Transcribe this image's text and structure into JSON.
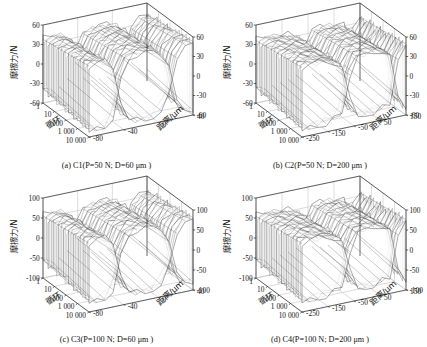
{
  "figure": {
    "type": "multi-panel-3d-surface",
    "panel_count": 4,
    "shared_axes": {
      "z_label": "摩擦力/N",
      "x_label": "循环",
      "y_label": "距离/μm",
      "x_ticks": [
        "1",
        "10",
        "100",
        "1 000",
        "10 000"
      ]
    }
  },
  "chart_data": [
    {
      "type": "line",
      "panel": "a",
      "caption_prefix": "(a)",
      "caption_sample": "C1",
      "caption_params": "(P=50 N; D=60 μm )",
      "caption_full": "(a) C1(P=50 N; D=60 μm )",
      "title": "C1(P=50 N; D=60 μm )",
      "xlabel": "循环",
      "ylabel": "距离/μm",
      "zlabel": "摩擦力/N",
      "x_ticks": [
        "1",
        "10",
        "100",
        "1 000",
        "10 000"
      ],
      "y_ticks": [
        "40",
        "0",
        "-40",
        "-80"
      ],
      "z_ticks": [
        "60",
        "30",
        "0",
        "-30",
        "-60"
      ],
      "z_ticks_right": [
        "60",
        "30",
        "0",
        "-30",
        "-60"
      ],
      "zlim": [
        -60,
        60
      ],
      "ylim": [
        -80,
        40
      ],
      "grid": true,
      "series_count": 28,
      "series": [
        {
          "name": "cycle 1",
          "values": [
            -38,
            -42,
            -40,
            -30,
            8,
            34,
            40,
            41,
            40,
            36,
            18,
            -26,
            -40,
            -42
          ]
        },
        {
          "name": "cycle 10",
          "values": [
            -40,
            -44,
            -42,
            -31,
            10,
            36,
            42,
            43,
            42,
            37,
            19,
            -27,
            -42,
            -44
          ]
        },
        {
          "name": "cycle 100",
          "values": [
            -43,
            -47,
            -45,
            -33,
            12,
            39,
            45,
            46,
            45,
            39,
            21,
            -29,
            -45,
            -47
          ]
        },
        {
          "name": "cycle 1 000",
          "values": [
            -46,
            -50,
            -48,
            -35,
            14,
            42,
            48,
            49,
            48,
            41,
            22,
            -31,
            -48,
            -50
          ]
        },
        {
          "name": "cycle 10 000",
          "values": [
            -49,
            -53,
            -51,
            -37,
            16,
            45,
            51,
            52,
            51,
            43,
            24,
            -33,
            -51,
            -53
          ]
        }
      ]
    },
    {
      "type": "line",
      "panel": "b",
      "caption_prefix": "(b)",
      "caption_sample": "C2",
      "caption_params": "(P=50 N; D=200 μm )",
      "caption_full": "(b) C2(P=50 N; D=200 μm )",
      "title": "C2(P=50 N; D=200 μm )",
      "xlabel": "循环",
      "ylabel": "距离/μm",
      "zlabel": "摩擦力/N",
      "x_ticks": [
        "1",
        "10",
        "100",
        "1 000",
        "10 000"
      ],
      "y_ticks": [
        "150",
        "50",
        "-50",
        "-150",
        "-250"
      ],
      "z_ticks": [
        "60",
        "30",
        "0",
        "-30",
        "-60"
      ],
      "z_ticks_right": [
        "60",
        "30",
        "0",
        "-30",
        "-60"
      ],
      "zlim": [
        -60,
        60
      ],
      "ylim": [
        -250,
        150
      ],
      "grid": true,
      "series_count": 28,
      "series": [
        {
          "name": "cycle 1",
          "values": [
            -36,
            -40,
            -38,
            -36,
            -34,
            -30,
            12,
            34,
            36,
            36,
            34,
            30,
            -20,
            -38
          ]
        },
        {
          "name": "cycle 10",
          "values": [
            -38,
            -42,
            -40,
            -38,
            -36,
            -31,
            14,
            36,
            38,
            38,
            36,
            31,
            -22,
            -40
          ]
        },
        {
          "name": "cycle 100",
          "values": [
            -41,
            -45,
            -43,
            -41,
            -38,
            -33,
            16,
            39,
            41,
            41,
            38,
            33,
            -24,
            -43
          ]
        },
        {
          "name": "cycle 1 000",
          "values": [
            -44,
            -48,
            -46,
            -44,
            -41,
            -35,
            18,
            42,
            44,
            44,
            41,
            35,
            -26,
            -46
          ]
        },
        {
          "name": "cycle 10 000",
          "values": [
            -47,
            -51,
            -49,
            -47,
            -43,
            -37,
            20,
            45,
            47,
            47,
            43,
            37,
            -28,
            -49
          ]
        }
      ]
    },
    {
      "type": "line",
      "panel": "c",
      "caption_prefix": "(c)",
      "caption_sample": "C3",
      "caption_params": "(P=100 N; D=60 μm )",
      "caption_full": "(c) C3(P=100 N; D=60 μm )",
      "title": "C3(P=100 N; D=60 μm )",
      "xlabel": "循环",
      "ylabel": "距离/μm",
      "zlabel": "摩擦力/N",
      "x_ticks": [
        "1",
        "10",
        "100",
        "1 000",
        "10 000"
      ],
      "y_ticks": [
        "40",
        "0",
        "-40",
        "-80"
      ],
      "z_ticks": [
        "100",
        "50",
        "0",
        "-50",
        "-100"
      ],
      "z_ticks_right": [
        "100",
        "50",
        "0",
        "-50",
        "-100"
      ],
      "zlim": [
        -100,
        100
      ],
      "ylim": [
        -80,
        40
      ],
      "grid": true,
      "series_count": 28,
      "series": [
        {
          "name": "cycle 1",
          "values": [
            -55,
            -62,
            -58,
            -44,
            14,
            52,
            60,
            62,
            60,
            54,
            26,
            -38,
            -58,
            -62
          ]
        },
        {
          "name": "cycle 10",
          "values": [
            -59,
            -66,
            -62,
            -47,
            16,
            56,
            64,
            66,
            64,
            57,
            28,
            -41,
            -62,
            -66
          ]
        },
        {
          "name": "cycle 100",
          "values": [
            -63,
            -71,
            -67,
            -50,
            18,
            60,
            69,
            71,
            69,
            61,
            30,
            -44,
            -67,
            -71
          ]
        },
        {
          "name": "cycle 1 000",
          "values": [
            -68,
            -76,
            -72,
            -54,
            20,
            64,
            74,
            76,
            74,
            65,
            32,
            -47,
            -72,
            -76
          ]
        },
        {
          "name": "cycle 10 000",
          "values": [
            -72,
            -81,
            -77,
            -57,
            22,
            68,
            79,
            81,
            79,
            69,
            34,
            -50,
            -77,
            -81
          ]
        }
      ]
    },
    {
      "type": "line",
      "panel": "d",
      "caption_prefix": "(d)",
      "caption_sample": "C4",
      "caption_params": "(P=100 N; D=200 μm )",
      "caption_full": "(d) C4(P=100 N; D=200 μm )",
      "title": "C4(P=100 N; D=200 μm )",
      "xlabel": "循环",
      "ylabel": "距离/μm",
      "zlabel": "摩擦力/N",
      "x_ticks": [
        "1",
        "10",
        "100",
        "1 000",
        "10 000"
      ],
      "y_ticks": [
        "150",
        "50",
        "-50",
        "-150",
        "-250"
      ],
      "z_ticks": [
        "100",
        "50",
        "0",
        "-50",
        "-100"
      ],
      "z_ticks_right": [
        "100",
        "50",
        "0",
        "-50",
        "-100"
      ],
      "zlim": [
        -100,
        100
      ],
      "ylim": [
        -250,
        150
      ],
      "grid": true,
      "series_count": 28,
      "series": [
        {
          "name": "cycle 1",
          "values": [
            -54,
            -60,
            -58,
            -55,
            -52,
            -46,
            18,
            52,
            56,
            56,
            52,
            46,
            -30,
            -58
          ]
        },
        {
          "name": "cycle 10",
          "values": [
            -58,
            -64,
            -62,
            -59,
            -55,
            -49,
            20,
            56,
            60,
            60,
            55,
            49,
            -33,
            -62
          ]
        },
        {
          "name": "cycle 100",
          "values": [
            -62,
            -69,
            -66,
            -63,
            -59,
            -52,
            22,
            60,
            64,
            64,
            59,
            52,
            -36,
            -66
          ]
        },
        {
          "name": "cycle 1 000",
          "values": [
            -67,
            -74,
            -71,
            -68,
            -63,
            -56,
            24,
            64,
            69,
            69,
            63,
            56,
            -39,
            -71
          ]
        },
        {
          "name": "cycle 10 000",
          "values": [
            -71,
            -79,
            -76,
            -72,
            -67,
            -60,
            26,
            68,
            74,
            74,
            67,
            60,
            -42,
            -76
          ]
        }
      ]
    }
  ],
  "colors": {
    "mesh": "#1b1b1b",
    "grid": "#b9b9b9",
    "axis": "#2a2a2a",
    "background": "#ffffff",
    "text": "#151515"
  }
}
